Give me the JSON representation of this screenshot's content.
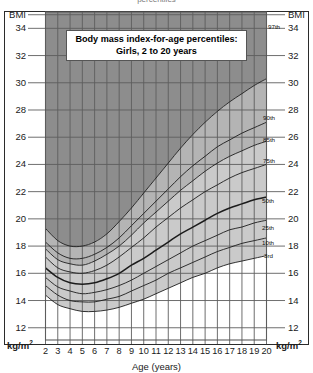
{
  "chart_data": {
    "type": "line",
    "title": "Body mass index-for-age percentiles:",
    "subtitle": "Girls, 2 to 20 years",
    "xlabel": "Age (years)",
    "ylabel": "BMI",
    "yunit": "kg/m2",
    "xlim": [
      2,
      20
    ],
    "ylim": [
      11.1,
      35.2
    ],
    "grid": true,
    "legend_position": "right-inline",
    "xticks": [
      2,
      3,
      4,
      5,
      6,
      7,
      8,
      9,
      10,
      11,
      12,
      13,
      14,
      15,
      16,
      17,
      18,
      19,
      20
    ],
    "yticks": [
      12,
      14,
      16,
      18,
      20,
      22,
      24,
      26,
      28,
      30,
      32,
      34
    ],
    "series": [
      {
        "name": "97th",
        "label": "97th",
        "emphasis": false,
        "x": [
          2,
          3,
          4,
          5,
          6,
          7,
          8,
          9,
          10,
          11,
          12,
          13,
          14,
          15,
          16,
          17,
          18,
          19,
          20
        ],
        "values": [
          19.3,
          18.4,
          18.0,
          18.0,
          18.3,
          18.9,
          19.8,
          20.8,
          21.9,
          23.0,
          24.1,
          25.2,
          26.2,
          27.1,
          27.9,
          28.6,
          29.2,
          29.8,
          30.3
        ]
      },
      {
        "name": "90th",
        "label": "90th",
        "emphasis": false,
        "x": [
          2,
          3,
          4,
          5,
          6,
          7,
          8,
          9,
          10,
          11,
          12,
          13,
          14,
          15,
          16,
          17,
          18,
          19,
          20
        ],
        "values": [
          18.3,
          17.5,
          17.1,
          17.1,
          17.4,
          17.9,
          18.6,
          19.5,
          20.4,
          21.3,
          22.2,
          23.1,
          23.9,
          24.6,
          25.3,
          25.8,
          26.3,
          26.7,
          27.1
        ]
      },
      {
        "name": "85th",
        "label": "85th",
        "emphasis": false,
        "x": [
          2,
          3,
          4,
          5,
          6,
          7,
          8,
          9,
          10,
          11,
          12,
          13,
          14,
          15,
          16,
          17,
          18,
          19,
          20
        ],
        "values": [
          17.8,
          17.0,
          16.7,
          16.6,
          16.9,
          17.4,
          18.0,
          18.8,
          19.7,
          20.5,
          21.3,
          22.1,
          22.8,
          23.5,
          24.1,
          24.6,
          25.0,
          25.4,
          25.7
        ]
      },
      {
        "name": "75th",
        "label": "75th",
        "emphasis": false,
        "x": [
          2,
          3,
          4,
          5,
          6,
          7,
          8,
          9,
          10,
          11,
          12,
          13,
          14,
          15,
          16,
          17,
          18,
          19,
          20
        ],
        "values": [
          17.2,
          16.4,
          16.1,
          16.0,
          16.2,
          16.6,
          17.2,
          17.9,
          18.6,
          19.4,
          20.1,
          20.8,
          21.4,
          22.0,
          22.5,
          23.0,
          23.4,
          23.7,
          24.0
        ]
      },
      {
        "name": "50th",
        "label": "50th",
        "emphasis": true,
        "x": [
          2,
          3,
          4,
          5,
          6,
          7,
          8,
          9,
          10,
          11,
          12,
          13,
          14,
          15,
          16,
          17,
          18,
          19,
          20
        ],
        "values": [
          16.4,
          15.7,
          15.3,
          15.2,
          15.3,
          15.6,
          16.0,
          16.6,
          17.1,
          17.7,
          18.3,
          18.9,
          19.4,
          19.9,
          20.4,
          20.8,
          21.1,
          21.4,
          21.6
        ]
      },
      {
        "name": "25th",
        "label": "25th",
        "emphasis": false,
        "x": [
          2,
          3,
          4,
          5,
          6,
          7,
          8,
          9,
          10,
          11,
          12,
          13,
          14,
          15,
          16,
          17,
          18,
          19,
          20
        ],
        "values": [
          15.7,
          15.0,
          14.7,
          14.5,
          14.6,
          14.8,
          15.1,
          15.5,
          16.0,
          16.5,
          17.0,
          17.5,
          18.0,
          18.4,
          18.8,
          19.2,
          19.4,
          19.7,
          19.9
        ]
      },
      {
        "name": "10th",
        "label": "10th",
        "emphasis": false,
        "x": [
          2,
          3,
          4,
          5,
          6,
          7,
          8,
          9,
          10,
          11,
          12,
          13,
          14,
          15,
          16,
          17,
          18,
          19,
          20
        ],
        "values": [
          15.1,
          14.4,
          14.0,
          13.9,
          13.9,
          14.1,
          14.3,
          14.7,
          15.1,
          15.5,
          16.0,
          16.4,
          16.8,
          17.2,
          17.6,
          17.9,
          18.2,
          18.4,
          18.6
        ]
      },
      {
        "name": "3rd",
        "label": "3rd",
        "emphasis": false,
        "x": [
          2,
          3,
          4,
          5,
          6,
          7,
          8,
          9,
          10,
          11,
          12,
          13,
          14,
          15,
          16,
          17,
          18,
          19,
          20
        ],
        "values": [
          14.4,
          13.7,
          13.4,
          13.2,
          13.2,
          13.3,
          13.5,
          13.8,
          14.1,
          14.5,
          14.9,
          15.3,
          15.7,
          16.0,
          16.4,
          16.7,
          16.9,
          17.1,
          17.3
        ]
      }
    ],
    "bands": [
      {
        "name": "above-97th",
        "color": "#8d8d8d"
      },
      {
        "name": "97th-to-85th",
        "color": "#b4b4b4"
      },
      {
        "name": "85th-to-5th",
        "color": "#cacaca"
      },
      {
        "name": "below-3rd",
        "color": "#ffffff"
      }
    ]
  },
  "axis": {
    "y_top_label": "BMI",
    "y_unit_label": "kg/m",
    "y_unit_sup": "2",
    "x_title": "Age (years)"
  },
  "top_trim": {
    "text": "percentiles"
  },
  "colors": {
    "band_dark": "#8d8d8d",
    "band_mid": "#b4b4b4",
    "band_light": "#cacaca",
    "grid": "#5d5d5d",
    "curve": "#1c1c1c",
    "frame": "#2b2b2b",
    "text": "#1a1a1a"
  }
}
